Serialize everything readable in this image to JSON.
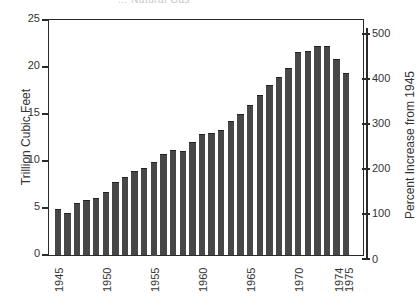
{
  "chart_data": {
    "type": "bar",
    "title": "... Natural Gas",
    "xlabel": "",
    "ylabel": "Trillion Cubic Feet",
    "ylabel_right": "Percent Increase from 1945",
    "ylim": [
      0,
      25
    ],
    "ylim_right": [
      0,
      500
    ],
    "yticks": [
      0,
      5,
      10,
      15,
      20,
      25
    ],
    "yticks_right": [
      0,
      100,
      200,
      300,
      400,
      500
    ],
    "xtick_labels": [
      "1945",
      "1950",
      "1955",
      "1960",
      "1965",
      "1970",
      "1974",
      "1975"
    ],
    "grid": false,
    "legend": null,
    "categories": [
      "1945",
      "1946",
      "1947",
      "1948",
      "1949",
      "1950",
      "1951",
      "1952",
      "1953",
      "1954",
      "1955",
      "1956",
      "1957",
      "1958",
      "1959",
      "1960",
      "1961",
      "1962",
      "1963",
      "1964",
      "1965",
      "1966",
      "1967",
      "1968",
      "1969",
      "1970",
      "1971",
      "1972",
      "1973",
      "1974",
      "1975"
    ],
    "values": [
      4.9,
      4.5,
      5.6,
      5.9,
      6.1,
      6.8,
      7.8,
      8.4,
      9.0,
      9.3,
      10.0,
      10.8,
      11.2,
      11.1,
      12.1,
      12.9,
      13.0,
      13.4,
      14.3,
      15.1,
      16.0,
      17.1,
      18.1,
      19.0,
      19.9,
      21.7,
      21.8,
      22.3,
      22.3,
      20.9,
      19.4
    ],
    "bar_color": "#474747"
  },
  "labels": {
    "title": "... Natural Gas",
    "ylabel": "Trillion Cubic Feet",
    "ylabel_right": "Percent Increase from 1945",
    "yticks": [
      "0",
      "5",
      "10",
      "15",
      "20",
      "25"
    ],
    "yticks_right": [
      "0",
      "100",
      "200",
      "300",
      "400",
      "500"
    ],
    "xticks": [
      "1945",
      "1950",
      "1955",
      "1960",
      "1965",
      "1970",
      "1974",
      "1975"
    ]
  }
}
